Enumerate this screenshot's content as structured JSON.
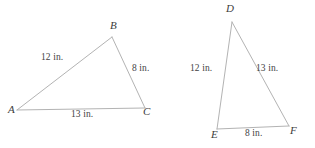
{
  "figure": {
    "background_color": "#ffffff",
    "stroke_color": "#b3b3b3",
    "text_color": "#3f3f3f",
    "width": 315,
    "height": 148,
    "unit": "in.",
    "triangles": [
      {
        "name": "triangle-abc",
        "vertices": [
          {
            "label": "A",
            "x": 17,
            "y": 110,
            "label_x": 8,
            "label_y": 110
          },
          {
            "label": "B",
            "x": 112,
            "y": 37,
            "label_x": 110,
            "label_y": 21
          },
          {
            "label": "C",
            "x": 145,
            "y": 108,
            "label_x": 146,
            "label_y": 109
          }
        ],
        "sides": [
          {
            "name": "side-ab",
            "label": "12 in.",
            "from": "A",
            "to": "B",
            "label_x": 42,
            "label_y": 55
          },
          {
            "name": "side-bc",
            "label": "8 in.",
            "from": "B",
            "to": "C",
            "label_x": 133,
            "label_y": 66
          },
          {
            "name": "side-ac",
            "label": "13 in.",
            "from": "A",
            "to": "C",
            "label_x": 72,
            "label_y": 111
          }
        ]
      },
      {
        "name": "triangle-def",
        "vertices": [
          {
            "label": "D",
            "x": 232,
            "y": 22,
            "label_x": 226,
            "label_y": 5
          },
          {
            "label": "E",
            "x": 217,
            "y": 129,
            "label_x": 212,
            "label_y": 130
          },
          {
            "label": "F",
            "x": 289,
            "y": 126,
            "label_x": 291,
            "label_y": 126
          }
        ],
        "sides": [
          {
            "name": "side-de",
            "label": "12 in.",
            "from": "D",
            "to": "E",
            "label_x": 191,
            "label_y": 66
          },
          {
            "name": "side-df",
            "label": "13 in.",
            "from": "D",
            "to": "F",
            "label_x": 256,
            "label_y": 66
          },
          {
            "name": "side-ef",
            "label": "8 in.",
            "from": "E",
            "to": "F",
            "label_x": 245,
            "label_y": 130
          }
        ]
      }
    ]
  }
}
